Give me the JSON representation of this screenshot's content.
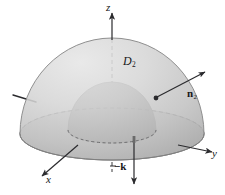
{
  "figure": {
    "name": "hemisphere-region-d2",
    "background_color": "#ffffff",
    "width": 225,
    "height": 195
  },
  "labels": {
    "axis_z": "z",
    "axis_y": "y",
    "axis_x": "x",
    "region": "D",
    "region_subscript": "2",
    "normal": "n",
    "normal_subscript": "2",
    "down_normal": "−k"
  },
  "colors": {
    "outer_surface_light": "#dcdcdc",
    "outer_surface_mid": "#c3c3c3",
    "outer_surface_dark": "#a8a8a8",
    "base_annulus": "#cfcfcf",
    "base_annulus_edge": "#bdbdbd",
    "inner_dome_light": "#a0a0a0",
    "inner_dome_dark": "#6e6e6e",
    "line": "#2b2b2e",
    "dashed_line": "#3a3a3d",
    "text": "#17171a"
  },
  "geometry": {
    "origin": {
      "x": 112,
      "y": 134
    },
    "outer_radius_x": 92,
    "outer_radius_y": 26,
    "outer_dome_height": 96,
    "inner_radius_x": 44,
    "inner_radius_y": 13,
    "inner_dome_height": 48
  },
  "vectors": [
    {
      "name": "normal-vector-n2",
      "label": "n",
      "subscript": "2",
      "from": {
        "x": 156,
        "y": 98
      },
      "to": {
        "x": 206,
        "y": 71
      },
      "has_basepoint_dot": true,
      "style": "solid"
    },
    {
      "name": "downward-normal-minus-k",
      "label": "−k",
      "from": {
        "x": 134,
        "y": 140
      },
      "to": {
        "x": 134,
        "y": 186
      },
      "has_basepoint_dot": false,
      "style": "solid"
    }
  ],
  "axes": [
    {
      "name": "z-axis",
      "label": "z",
      "direction": "up",
      "dashed_inside_solid_outside": true
    },
    {
      "name": "y-axis",
      "label": "y",
      "direction": "right-down",
      "dashed_inside_solid_outside": true
    },
    {
      "name": "x-axis",
      "label": "x",
      "direction": "left-down",
      "dashed_inside_solid_outside": true
    }
  ]
}
